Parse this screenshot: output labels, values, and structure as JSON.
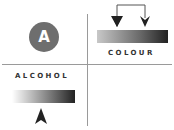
{
  "badge": {
    "letter": "A",
    "color": "#6e6e6e"
  },
  "quadrants": {
    "top_right": {
      "label": "COLOUR",
      "gradient": [
        "#c8c8c8",
        "#222222"
      ],
      "indicator": "two-down-arrows"
    },
    "bottom_left": {
      "label": "ALCOHOL",
      "gradient": [
        "#ffffff",
        "#222222"
      ],
      "indicator": "up-arrow"
    }
  }
}
